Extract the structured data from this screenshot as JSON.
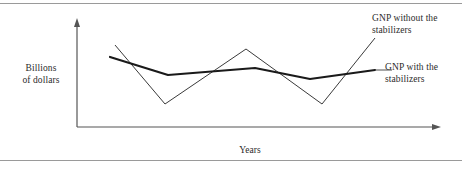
{
  "figure": {
    "frame": {
      "top_rule": true,
      "bottom_rule": true,
      "rule_color": "#9a9a9a"
    },
    "axes": {
      "y_label": "Billions\nof dollars",
      "x_label": "Years",
      "axis_color": "#555555",
      "y_axis_arrow": "arrow-up",
      "x_axis_arrow": "arrow-right"
    },
    "labels": {
      "without": "GNP without the\nstabilizers",
      "with": "GNP with the\nstabilizers"
    }
  },
  "chart_data": {
    "type": "line",
    "title": "",
    "xlabel": "Years",
    "ylabel": "Billions of dollars",
    "grid": false,
    "legend_position": "right-annotations",
    "axis_ticks": {
      "x": [],
      "y": []
    },
    "xlim": [
      0,
      100
    ],
    "ylim": [
      0,
      100
    ],
    "series": [
      {
        "name": "GNP without the stabilizers",
        "style": "thin",
        "color": "#3a3a3a",
        "width": 1,
        "points": [
          {
            "x": 115,
            "y": 45
          },
          {
            "x": 165,
            "y": 104
          },
          {
            "x": 246,
            "y": 49
          },
          {
            "x": 322,
            "y": 104
          },
          {
            "x": 375,
            "y": 38
          }
        ]
      },
      {
        "name": "GNP with the stabilizers",
        "style": "thick",
        "color": "#1a1a1a",
        "width": 2.2,
        "points": [
          {
            "x": 110,
            "y": 57
          },
          {
            "x": 168,
            "y": 75
          },
          {
            "x": 255,
            "y": 68
          },
          {
            "x": 310,
            "y": 79
          },
          {
            "x": 375,
            "y": 70
          }
        ]
      }
    ],
    "leader_line": {
      "from": {
        "x": 376,
        "y": 70
      },
      "to": {
        "x": 392,
        "y": 70
      }
    },
    "annotation_note": "Thin volatile line shows unmitigated GNP swings; thick smoothed line shows GNP moderated by automatic stabilizers."
  }
}
